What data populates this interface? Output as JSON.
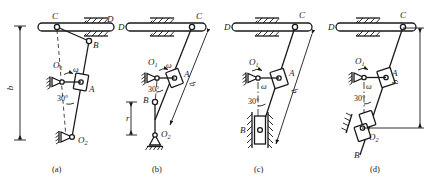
{
  "figure": {
    "subfigures": [
      {
        "id": "a",
        "caption": "(a)",
        "labels": {
          "C": "C",
          "D": "D",
          "B": "B",
          "A": "A",
          "O1": "O",
          "O1_sub": "1",
          "O2": "O",
          "O2_sub": "2",
          "omega": "ω",
          "angle": "30°",
          "dimension": "b"
        }
      },
      {
        "id": "b",
        "caption": "(b)",
        "labels": {
          "C": "C",
          "D": "D",
          "B": "B",
          "A": "A",
          "O1": "O",
          "O1_sub": "1",
          "O2": "O",
          "O2_sub": "2",
          "omega": "ω",
          "angle": "30°",
          "dimension": "b",
          "dimension2": "r"
        }
      },
      {
        "id": "c",
        "caption": "(c)",
        "labels": {
          "C": "C",
          "D": "D",
          "B": "B",
          "A": "A",
          "O1": "O",
          "O1_sub": "1",
          "omega": "ω",
          "angle": "30°",
          "dimension": "b"
        }
      },
      {
        "id": "d",
        "caption": "(d)",
        "labels": {
          "C": "C",
          "D": "D",
          "B": "B",
          "A": "A",
          "O1": "O",
          "O1_sub": "1",
          "O2": "O",
          "O2_sub": "2",
          "omega": "ω",
          "angle": "30°",
          "dimension": "b"
        }
      }
    ],
    "colors": {
      "line": "#1a1a1a",
      "background": "#ffffff"
    }
  }
}
